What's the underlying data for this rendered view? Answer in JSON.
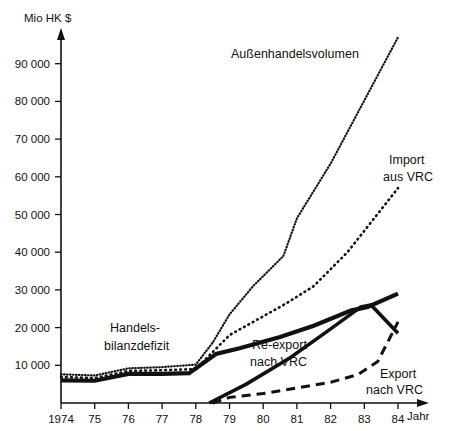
{
  "chart_data": {
    "type": "line",
    "title": "",
    "ylabel": "Mio HK $",
    "xlabel": "Jahr",
    "grid": false,
    "legend_position": "inline-annotations",
    "ylim": [
      0,
      100000
    ],
    "xlim": [
      1974,
      1984
    ],
    "y_ticks": [
      10000,
      20000,
      30000,
      40000,
      50000,
      60000,
      70000,
      80000,
      90000
    ],
    "y_tick_labels": [
      "10 000",
      "20 000",
      "30 000",
      "40 000",
      "50 000",
      "60 000",
      "70 000",
      "80 000",
      "90 000"
    ],
    "x_ticks": [
      1974,
      1975,
      1976,
      1977,
      1978,
      1979,
      1980,
      1981,
      1982,
      1983,
      1984
    ],
    "x_tick_labels": [
      "1974",
      "75",
      "76",
      "77",
      "78",
      "79",
      "80",
      "81",
      "82",
      "83",
      "84"
    ],
    "x": [
      1974,
      1975,
      1976,
      1977,
      1978,
      1979,
      1980,
      1981,
      1982,
      1983,
      1984
    ],
    "series": [
      {
        "name": "Außenhandelsvolumen",
        "style": "fine-dotted",
        "label_x": 1981.2,
        "label_y": 92000,
        "values": [
          7600,
          7300,
          9200,
          9500,
          10200,
          16000,
          23500,
          31000,
          39000,
          49000,
          63500,
          97000
        ],
        "x_values": [
          1974,
          1975,
          1976,
          1977,
          1978,
          1978.5,
          1979,
          1979.7,
          1980.6,
          1981,
          1982,
          1984
        ]
      },
      {
        "name": "Import aus VRC",
        "style": "coarse-dotted",
        "label_x": 1983.1,
        "label_y": 62500,
        "values": [
          6900,
          6600,
          8500,
          8700,
          9000,
          13500,
          18000,
          23000,
          26500,
          31000,
          40000,
          57000
        ],
        "x_values": [
          1974,
          1975,
          1976,
          1977,
          1978,
          1978.5,
          1979,
          1980,
          1980.7,
          1981.5,
          1982.5,
          1984
        ]
      },
      {
        "name": "Handelsbilanzdefizit",
        "style": "thick-solid",
        "label_x": 1977.2,
        "label_y": 20000,
        "values": [
          6000,
          5900,
          7700,
          7700,
          7900,
          13000,
          14500,
          17500,
          20500,
          24500,
          25500,
          29000
        ],
        "x_values": [
          1974,
          1975,
          1976,
          1977,
          1977.8,
          1978.6,
          1979.3,
          1980.5,
          1981.5,
          1982.6,
          1983.1,
          1984
        ]
      },
      {
        "name": "Re-export nach VRC",
        "style": "solid",
        "label_x": 1980.6,
        "label_y": 13500,
        "values": [
          0,
          5000,
          12000,
          19000,
          25500,
          26000,
          18500
        ],
        "x_values": [
          1978.4,
          1979.5,
          1980.8,
          1981.9,
          1982.9,
          1983.2,
          1984
        ]
      },
      {
        "name": "Export nach VRC",
        "style": "dashed",
        "label_x": 1982.6,
        "label_y": 6500,
        "values": [
          0,
          1500,
          2500,
          4000,
          5500,
          7500,
          11000,
          21500
        ],
        "x_values": [
          1978.5,
          1979,
          1980,
          1981,
          1982,
          1982.8,
          1983.4,
          1984
        ]
      }
    ],
    "annotations": [
      {
        "text": "Außenhandelsvolumen",
        "x": 231,
        "y": 58
      },
      {
        "text": "Import",
        "x": 389,
        "y": 164
      },
      {
        "text": "aus VRC",
        "x": 383,
        "y": 181
      },
      {
        "text": "Handels-",
        "x": 110,
        "y": 332
      },
      {
        "text": "bilanzdefizit",
        "x": 104,
        "y": 350
      },
      {
        "text": "Re-export",
        "x": 252,
        "y": 349
      },
      {
        "text": "nach VRC",
        "x": 250,
        "y": 366
      },
      {
        "text": "Export",
        "x": 380,
        "y": 378
      },
      {
        "text": "nach VRC",
        "x": 366,
        "y": 394
      }
    ]
  },
  "axes": {
    "y_axis_title": "Mio HK $",
    "x_axis_title": "Jahr"
  }
}
